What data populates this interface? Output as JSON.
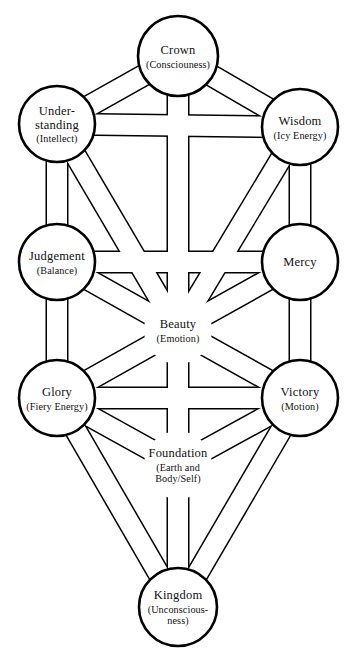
{
  "diagram": {
    "name": "Kabbalistic Tree of Life",
    "background_color": "#ffffff",
    "stroke_color": "#000000",
    "fill_color": "#ffffff",
    "width": 357,
    "height": 658
  },
  "nodes": [
    {
      "id": "crown",
      "title": "Crown",
      "subtitle": "(Consciouness)",
      "subtitle_lines": [
        "(Consciouness)"
      ],
      "title_lines": [
        "Crown"
      ],
      "cx": 178,
      "cy": 56,
      "r": 40,
      "has_circle": true
    },
    {
      "id": "understanding",
      "title": "Under-standing",
      "subtitle": "(Intellect)",
      "subtitle_lines": [
        "(Intellect)"
      ],
      "title_lines": [
        "Under-",
        "standing"
      ],
      "cx": 57,
      "cy": 124,
      "r": 38,
      "has_circle": true
    },
    {
      "id": "wisdom",
      "title": "Wisdom",
      "subtitle": "(Icy Energy)",
      "subtitle_lines": [
        "(Icy Energy)"
      ],
      "title_lines": [
        "Wisdom"
      ],
      "cx": 300,
      "cy": 127,
      "r": 38,
      "has_circle": true
    },
    {
      "id": "judgement",
      "title": "Judgement",
      "subtitle": "(Balance)",
      "subtitle_lines": [
        "(Balance)"
      ],
      "title_lines": [
        "Judgement"
      ],
      "cx": 57,
      "cy": 262,
      "r": 38,
      "has_circle": true
    },
    {
      "id": "mercy",
      "title": "Mercy",
      "subtitle": "",
      "subtitle_lines": [],
      "title_lines": [
        "Mercy"
      ],
      "cx": 300,
      "cy": 262,
      "r": 38,
      "has_circle": true
    },
    {
      "id": "beauty",
      "title": "Beauty",
      "subtitle": "(Emotion)",
      "subtitle_lines": [
        "(Emotion)"
      ],
      "title_lines": [
        "Beauty"
      ],
      "cx": 178,
      "cy": 330,
      "r": 38,
      "has_circle": false
    },
    {
      "id": "glory",
      "title": "Glory",
      "subtitle": "(Fiery Energy)",
      "subtitle_lines": [
        "(Fiery Energy)"
      ],
      "title_lines": [
        "Glory"
      ],
      "cx": 57,
      "cy": 398,
      "r": 38,
      "has_circle": true
    },
    {
      "id": "victory",
      "title": "Victory",
      "subtitle": "(Motion)",
      "subtitle_lines": [
        "(Motion)"
      ],
      "title_lines": [
        "Victory"
      ],
      "cx": 300,
      "cy": 398,
      "r": 38,
      "has_circle": true
    },
    {
      "id": "foundation",
      "title": "Foundation",
      "subtitle": "(Earth and Body/Self)",
      "subtitle_lines": [
        "(Earth and",
        "Body/Self)"
      ],
      "title_lines": [
        "Foundation"
      ],
      "cx": 178,
      "cy": 465,
      "r": 38,
      "has_circle": false
    },
    {
      "id": "kingdom",
      "title": "Kingdom",
      "subtitle": "(Unconscious-ness)",
      "subtitle_lines": [
        "(Unconscious-",
        "ness)"
      ],
      "title_lines": [
        "Kingdom"
      ],
      "cx": 178,
      "cy": 607,
      "r": 39,
      "has_circle": true
    }
  ],
  "paths": [
    {
      "id": "crown-understanding",
      "from": "crown",
      "to": "understanding",
      "width": 20
    },
    {
      "id": "crown-wisdom",
      "from": "crown",
      "to": "wisdom",
      "width": 20
    },
    {
      "id": "crown-beauty",
      "from": "crown",
      "to": "beauty",
      "width": 20
    },
    {
      "id": "understanding-wisdom",
      "from": "understanding",
      "to": "wisdom",
      "width": 20
    },
    {
      "id": "understanding-judgement",
      "from": "understanding",
      "to": "judgement",
      "width": 20
    },
    {
      "id": "understanding-beauty",
      "from": "understanding",
      "to": "beauty",
      "width": 20
    },
    {
      "id": "wisdom-mercy",
      "from": "wisdom",
      "to": "mercy",
      "width": 20
    },
    {
      "id": "wisdom-beauty",
      "from": "wisdom",
      "to": "beauty",
      "width": 20
    },
    {
      "id": "judgement-mercy",
      "from": "judgement",
      "to": "mercy",
      "width": 20
    },
    {
      "id": "judgement-beauty",
      "from": "judgement",
      "to": "beauty",
      "width": 20
    },
    {
      "id": "judgement-glory",
      "from": "judgement",
      "to": "glory",
      "width": 20
    },
    {
      "id": "mercy-beauty",
      "from": "mercy",
      "to": "beauty",
      "width": 20
    },
    {
      "id": "mercy-victory",
      "from": "mercy",
      "to": "victory",
      "width": 20
    },
    {
      "id": "beauty-glory",
      "from": "beauty",
      "to": "glory",
      "width": 20
    },
    {
      "id": "beauty-victory",
      "from": "beauty",
      "to": "victory",
      "width": 20
    },
    {
      "id": "beauty-foundation",
      "from": "beauty",
      "to": "foundation",
      "width": 20
    },
    {
      "id": "glory-victory",
      "from": "glory",
      "to": "victory",
      "width": 20
    },
    {
      "id": "glory-foundation",
      "from": "glory",
      "to": "foundation",
      "width": 20
    },
    {
      "id": "glory-kingdom",
      "from": "glory",
      "to": "kingdom",
      "width": 20
    },
    {
      "id": "victory-foundation",
      "from": "victory",
      "to": "foundation",
      "width": 20
    },
    {
      "id": "victory-kingdom",
      "from": "victory",
      "to": "kingdom",
      "width": 20
    },
    {
      "id": "foundation-kingdom",
      "from": "foundation",
      "to": "kingdom",
      "width": 20
    }
  ]
}
